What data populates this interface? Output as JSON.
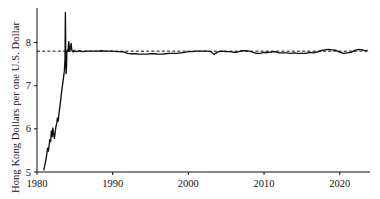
{
  "chart_data": {
    "type": "line",
    "title": "",
    "subtitle": "",
    "xlabel": "",
    "ylabel": "Hong Kong Dollars per one U.S. Dollar",
    "xlim": [
      1980,
      2024
    ],
    "ylim": [
      5,
      8.8
    ],
    "grid": false,
    "legend": null,
    "xticks": [
      1980,
      1990,
      2000,
      2010,
      2020
    ],
    "xtick_labels": [
      "1980",
      "1990",
      "2000",
      "2010",
      "2020"
    ],
    "yticks": [
      5,
      6,
      7,
      8
    ],
    "ytick_labels": [
      "5",
      "6",
      "7",
      "8"
    ],
    "line_color": "#101010",
    "annotations": [
      {
        "name": "peg-reference-line",
        "type": "horizontal-dashed-line",
        "value": 7.8,
        "color": "#101010",
        "label": ""
      }
    ],
    "series": [
      {
        "name": "HKD per USD",
        "color": "#101010",
        "x": [
          1980.9,
          1981.0,
          1981.1,
          1981.2,
          1981.3,
          1981.4,
          1981.5,
          1981.6,
          1981.7,
          1981.8,
          1981.9,
          1982.0,
          1982.1,
          1982.2,
          1982.3,
          1982.4,
          1982.5,
          1982.6,
          1982.7,
          1982.8,
          1982.9,
          1983.0,
          1983.1,
          1983.2,
          1983.3,
          1983.4,
          1983.5,
          1983.6,
          1983.65,
          1983.7,
          1983.72,
          1983.75,
          1983.78,
          1983.8,
          1983.85,
          1983.9,
          1983.95,
          1984.0,
          1984.1,
          1984.2,
          1984.3,
          1984.4,
          1984.5,
          1984.6,
          1984.7,
          1984.8,
          1984.9,
          1985.0,
          1985.2,
          1985.4,
          1985.6,
          1985.8,
          1986.0,
          1986.5,
          1987.0,
          1987.5,
          1988.0,
          1988.5,
          1989.0,
          1989.5,
          1990.0,
          1990.5,
          1991.0,
          1991.5,
          1992.0,
          1992.5,
          1993.0,
          1993.5,
          1994.0,
          1994.5,
          1995.0,
          1995.5,
          1996.0,
          1996.5,
          1997.0,
          1997.5,
          1998.0,
          1998.5,
          1999.0,
          1999.5,
          2000.0,
          2000.5,
          2001.0,
          2001.5,
          2002.0,
          2002.5,
          2003.0,
          2003.4,
          2003.6,
          2003.8,
          2004.0,
          2004.5,
          2005.0,
          2005.5,
          2006.0,
          2006.5,
          2007.0,
          2007.5,
          2008.0,
          2008.5,
          2009.0,
          2009.5,
          2010.0,
          2010.5,
          2011.0,
          2011.5,
          2012.0,
          2012.5,
          2013.0,
          2013.5,
          2014.0,
          2014.5,
          2015.0,
          2015.5,
          2016.0,
          2016.5,
          2017.0,
          2017.5,
          2018.0,
          2018.5,
          2019.0,
          2019.5,
          2020.0,
          2020.5,
          2021.0,
          2021.5,
          2022.0,
          2022.5,
          2023.0,
          2023.3,
          2023.6
        ],
        "values": [
          5.05,
          5.13,
          5.22,
          5.3,
          5.42,
          5.55,
          5.48,
          5.62,
          5.75,
          5.7,
          5.95,
          5.82,
          6.02,
          5.88,
          5.78,
          5.92,
          6.05,
          6.12,
          6.25,
          6.18,
          6.35,
          6.48,
          6.62,
          6.78,
          6.92,
          7.05,
          7.18,
          7.32,
          7.45,
          7.62,
          8.05,
          8.7,
          8.25,
          7.62,
          7.28,
          7.45,
          7.8,
          7.82,
          7.8,
          8.02,
          7.8,
          7.86,
          7.98,
          7.82,
          7.8,
          7.78,
          7.82,
          7.8,
          7.79,
          7.8,
          7.81,
          7.8,
          7.79,
          7.8,
          7.8,
          7.8,
          7.8,
          7.81,
          7.8,
          7.8,
          7.8,
          7.79,
          7.79,
          7.78,
          7.75,
          7.74,
          7.74,
          7.73,
          7.73,
          7.73,
          7.74,
          7.74,
          7.73,
          7.73,
          7.74,
          7.75,
          7.75,
          7.75,
          7.76,
          7.77,
          7.79,
          7.79,
          7.8,
          7.8,
          7.8,
          7.8,
          7.79,
          7.72,
          7.75,
          7.77,
          7.79,
          7.8,
          7.79,
          7.79,
          7.77,
          7.78,
          7.81,
          7.81,
          7.8,
          7.78,
          7.75,
          7.75,
          7.77,
          7.77,
          7.78,
          7.79,
          7.76,
          7.76,
          7.76,
          7.75,
          7.76,
          7.75,
          7.75,
          7.75,
          7.77,
          7.76,
          7.78,
          7.81,
          7.83,
          7.84,
          7.83,
          7.82,
          7.78,
          7.75,
          7.76,
          7.77,
          7.82,
          7.84,
          7.83,
          7.81,
          7.82
        ]
      }
    ]
  }
}
